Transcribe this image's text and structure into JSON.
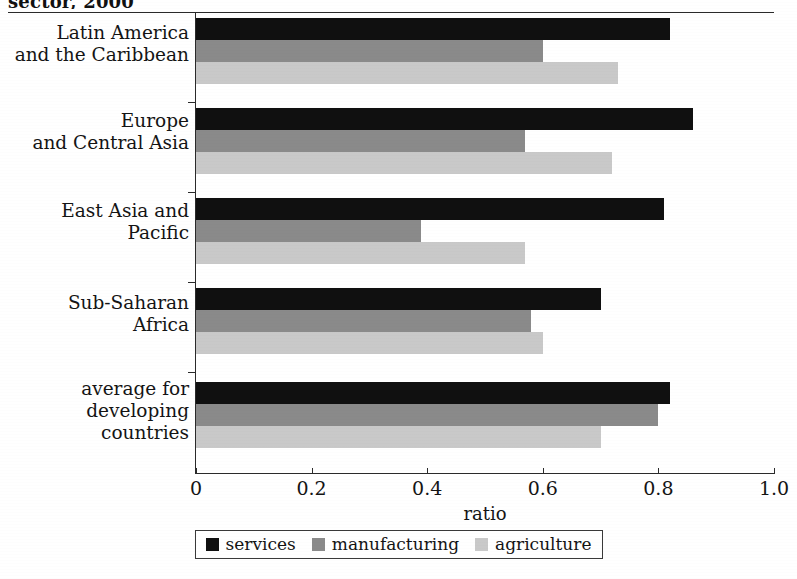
{
  "chart_data": {
    "type": "bar",
    "orientation": "horizontal",
    "title": "sector, 2000",
    "categories": [
      "Latin America\nand the Caribbean",
      "Europe\nand Central Asia",
      "East Asia and\nPacific",
      "Sub-Saharan\nAfrica",
      "average for\ndeveloping\ncountries"
    ],
    "series": [
      {
        "name": "services",
        "color": "#101010",
        "values": [
          0.82,
          0.86,
          0.81,
          0.7,
          0.82
        ]
      },
      {
        "name": "manufacturing",
        "color": "#8a8a8a",
        "values": [
          0.6,
          0.57,
          0.39,
          0.58,
          0.8
        ]
      },
      {
        "name": "agriculture",
        "color": "#c9c9c9",
        "values": [
          0.73,
          0.72,
          0.57,
          0.6,
          0.7
        ]
      }
    ],
    "xlabel": "ratio",
    "ylabel": "",
    "xlim": [
      0,
      1.0
    ],
    "xticks": [
      0,
      0.2,
      0.4,
      0.6,
      0.8,
      1.0
    ],
    "xtick_labels": [
      "0",
      "0.2",
      "0.4",
      "0.6",
      "0.8",
      "1.0"
    ],
    "grid": false,
    "legend_position": "bottom"
  },
  "legend": {
    "items": [
      {
        "label": "services"
      },
      {
        "label": "manufacturing"
      },
      {
        "label": "agriculture"
      }
    ]
  }
}
